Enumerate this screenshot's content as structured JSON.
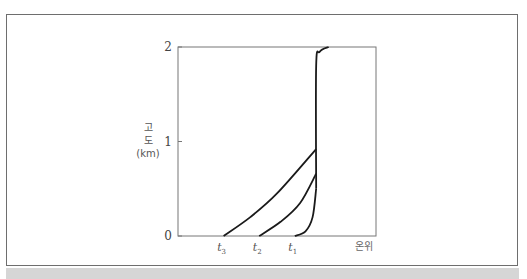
{
  "chart_data": {
    "type": "line",
    "title": "",
    "ylabel_lines": [
      "고",
      "도",
      "(km)"
    ],
    "xlabel": "온위",
    "ylim": [
      0,
      2
    ],
    "y_ticks": [
      {
        "value": 0,
        "label": "0"
      },
      {
        "value": 1,
        "label": "1"
      },
      {
        "value": 2,
        "label": "2"
      }
    ],
    "x_markers": [
      {
        "name": "t3",
        "base": "t",
        "sub": "3",
        "x": 0.2
      },
      {
        "name": "t2",
        "base": "t",
        "sub": "2",
        "x": 0.4
      },
      {
        "name": "t1",
        "base": "t",
        "sub": "1",
        "x": 0.6
      }
    ],
    "xlim": [
      0,
      1
    ],
    "residual_layer_x": 0.72,
    "series": [
      {
        "name": "t3",
        "points": [
          [
            0.2,
            0
          ],
          [
            0.35,
            0.2
          ],
          [
            0.5,
            0.45
          ],
          [
            0.72,
            0.92
          ]
        ]
      },
      {
        "name": "t2",
        "points": [
          [
            0.4,
            0
          ],
          [
            0.52,
            0.15
          ],
          [
            0.63,
            0.35
          ],
          [
            0.72,
            0.66
          ]
        ]
      },
      {
        "name": "t1",
        "points": [
          [
            0.6,
            0
          ],
          [
            0.66,
            0.05
          ],
          [
            0.7,
            0.2
          ],
          [
            0.72,
            0.5
          ]
        ]
      },
      {
        "name": "upper-profile",
        "points": [
          [
            0.72,
            0.5
          ],
          [
            0.72,
            1.8
          ],
          [
            0.74,
            1.95
          ],
          [
            0.79,
            2.0
          ]
        ]
      }
    ]
  }
}
